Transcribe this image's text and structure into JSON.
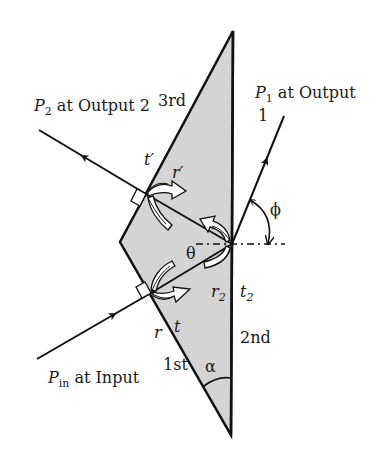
{
  "diagram": {
    "type": "prism-ray-optics",
    "colors": {
      "prism_fill": "#d4d4d4",
      "stroke": "#111111",
      "background": "#ffffff"
    },
    "labels": {
      "p2_sym": "P",
      "p2_sub": "2",
      "p2_text": " at Output 2",
      "p1_sym": "P",
      "p1_sub": "1",
      "p1_text": " at Output",
      "p1_line2": "1",
      "pin_sym": "P",
      "pin_sub": "in",
      "pin_text": " at Input",
      "face3": "3rd",
      "face2": "2nd",
      "face1": "1st",
      "t_prime": "t′",
      "r_prime": "r′",
      "phi": "ϕ",
      "theta": "θ",
      "r2_sym": "r",
      "r2_sub": "2",
      "t2_sym": "t",
      "t2_sub": "2",
      "r": "r",
      "t": "t",
      "alpha": "α"
    },
    "rays": [
      {
        "name": "input",
        "from": [
          37,
          359
        ],
        "to": [
          151,
          293
        ]
      },
      {
        "name": "internal-1",
        "from": [
          151,
          293
        ],
        "to": [
          232,
          244
        ]
      },
      {
        "name": "internal-2",
        "from": [
          232,
          244
        ],
        "to": [
          146,
          194
        ]
      },
      {
        "name": "output-2",
        "from": [
          146,
          194
        ],
        "to": [
          39,
          130
        ]
      },
      {
        "name": "output-1",
        "from": [
          232,
          244
        ],
        "to": [
          284,
          116
        ]
      }
    ]
  }
}
